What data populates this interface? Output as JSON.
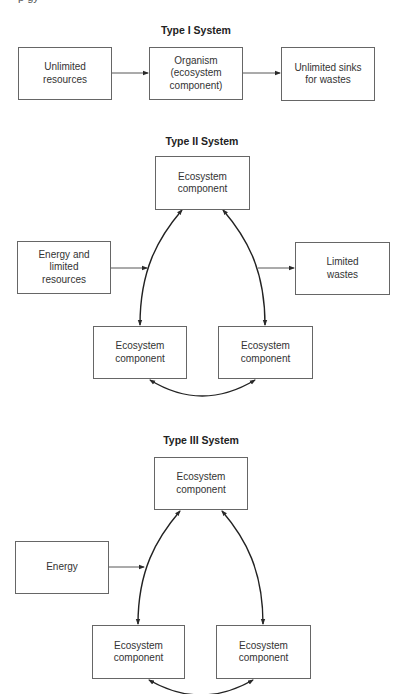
{
  "header_fragment": "p                                    gy",
  "systems": [
    {
      "title": "Type I System",
      "nodes": [
        {
          "id": "resources",
          "label_lines": [
            "Unlimited",
            "resources"
          ]
        },
        {
          "id": "organism",
          "label_lines": [
            "Organism",
            "(ecosystem",
            "component)"
          ]
        },
        {
          "id": "sinks",
          "label_lines": [
            "Unlimited sinks",
            "for wastes"
          ]
        }
      ],
      "edges": [
        {
          "from": "resources",
          "to": "organism",
          "type": "arrow"
        },
        {
          "from": "organism",
          "to": "sinks",
          "type": "arrow"
        }
      ]
    },
    {
      "title": "Type II System",
      "nodes": [
        {
          "id": "top",
          "label_lines": [
            "Ecosystem",
            "component"
          ]
        },
        {
          "id": "input",
          "label_lines": [
            "Energy and",
            "limited",
            "resources"
          ]
        },
        {
          "id": "output",
          "label_lines": [
            "Limited",
            "wastes"
          ]
        },
        {
          "id": "bottom_left",
          "label_lines": [
            "Ecosystem",
            "component"
          ]
        },
        {
          "id": "bottom_right",
          "label_lines": [
            "Ecosystem",
            "component"
          ]
        }
      ],
      "edges": [
        {
          "from": "input",
          "to": "cycle",
          "type": "arrow"
        },
        {
          "from": "cycle",
          "to": "output",
          "type": "arrow"
        },
        {
          "from": "top",
          "to": "bottom_left",
          "type": "bidirectional-arc"
        },
        {
          "from": "top",
          "to": "bottom_right",
          "type": "bidirectional-arc"
        },
        {
          "from": "bottom_left",
          "to": "bottom_right",
          "type": "bidirectional-arc"
        }
      ]
    },
    {
      "title": "Type III System",
      "nodes": [
        {
          "id": "top",
          "label_lines": [
            "Ecosystem",
            "component"
          ]
        },
        {
          "id": "input",
          "label_lines": [
            "Energy"
          ]
        },
        {
          "id": "bottom_left",
          "label_lines": [
            "Ecosystem",
            "component"
          ]
        },
        {
          "id": "bottom_right",
          "label_lines": [
            "Ecosystem",
            "component"
          ]
        }
      ],
      "edges": [
        {
          "from": "input",
          "to": "cycle",
          "type": "arrow"
        },
        {
          "from": "top",
          "to": "bottom_left",
          "type": "bidirectional-arc"
        },
        {
          "from": "top",
          "to": "bottom_right",
          "type": "bidirectional-arc"
        },
        {
          "from": "bottom_left",
          "to": "bottom_right",
          "type": "bidirectional-arc"
        }
      ]
    }
  ],
  "colors": {
    "line": "#2a2a2a",
    "box_border": "#666666",
    "background": "#ffffff"
  }
}
